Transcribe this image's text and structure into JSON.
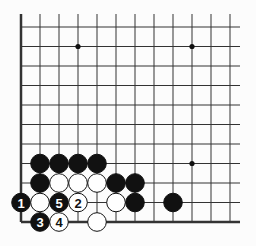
{
  "diagram": {
    "type": "go-board-corner",
    "corner": "bottom-left",
    "grid": {
      "origin_x": 21,
      "origin_y": 222,
      "spacing_x": 19,
      "spacing_y": 19.5,
      "cols": 12,
      "rows": 11
    },
    "star_points": [
      {
        "col": 3,
        "row": 9
      },
      {
        "col": 9,
        "row": 9
      },
      {
        "col": 9,
        "row": 3
      }
    ],
    "stones": [
      {
        "col": 1,
        "row": 3,
        "color": "black",
        "label": ""
      },
      {
        "col": 2,
        "row": 3,
        "color": "black",
        "label": ""
      },
      {
        "col": 3,
        "row": 3,
        "color": "black",
        "label": ""
      },
      {
        "col": 4,
        "row": 3,
        "color": "black",
        "label": ""
      },
      {
        "col": 1,
        "row": 2,
        "color": "black",
        "label": ""
      },
      {
        "col": 2,
        "row": 2,
        "color": "white",
        "label": ""
      },
      {
        "col": 3,
        "row": 2,
        "color": "white",
        "label": ""
      },
      {
        "col": 4,
        "row": 2,
        "color": "white",
        "label": ""
      },
      {
        "col": 5,
        "row": 2,
        "color": "black",
        "label": ""
      },
      {
        "col": 6,
        "row": 2,
        "color": "black",
        "label": ""
      },
      {
        "col": 0,
        "row": 1,
        "color": "black",
        "label": "1"
      },
      {
        "col": 1,
        "row": 1,
        "color": "white",
        "label": ""
      },
      {
        "col": 2,
        "row": 1,
        "color": "black",
        "label": "5"
      },
      {
        "col": 3,
        "row": 1,
        "color": "white",
        "label": "2"
      },
      {
        "col": 5,
        "row": 1,
        "color": "white",
        "label": ""
      },
      {
        "col": 6,
        "row": 1,
        "color": "black",
        "label": ""
      },
      {
        "col": 8,
        "row": 1,
        "color": "black",
        "label": ""
      },
      {
        "col": 1,
        "row": 0,
        "color": "black",
        "label": "3"
      },
      {
        "col": 2,
        "row": 0,
        "color": "white",
        "label": "4"
      },
      {
        "col": 4,
        "row": 0,
        "color": "white",
        "label": ""
      }
    ],
    "colors": {
      "line": "#333333",
      "black": "#111111",
      "white": "#ffffff",
      "background": "#fcfcfc"
    }
  }
}
